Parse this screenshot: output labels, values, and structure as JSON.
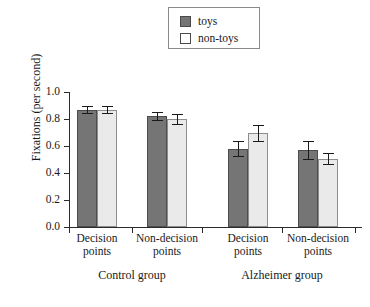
{
  "chart_data": {
    "type": "bar",
    "title": "",
    "xlabel": "",
    "ylabel": "Fixations (per second)",
    "ylim": [
      0.0,
      1.0
    ],
    "ytick_labels": [
      "1.0",
      "0.8",
      "0.6",
      "0.4",
      "0.2",
      "0.0"
    ],
    "ytick_values": [
      1.0,
      0.8,
      0.6,
      0.4,
      0.2,
      0.0
    ],
    "grid": false,
    "legend_position": "top-center",
    "categories": [
      "Decision points",
      "Non-decision points",
      "Decision points",
      "Non-decision points"
    ],
    "group_labels": [
      "Control group",
      "Alzheimer group"
    ],
    "series": [
      {
        "name": "toys",
        "color": "#757575",
        "values": [
          0.87,
          0.825,
          0.58,
          0.57
        ],
        "errors": [
          0.025,
          0.03,
          0.055,
          0.065
        ]
      },
      {
        "name": "non-toys",
        "color": "#eaeaea",
        "values": [
          0.87,
          0.8,
          0.695,
          0.505
        ],
        "errors": [
          0.025,
          0.035,
          0.06,
          0.04
        ]
      }
    ]
  },
  "legend": {
    "items": [
      {
        "label": "toys",
        "swatch": "toys-swatch"
      },
      {
        "label": "non-toys",
        "swatch": "non-toys-swatch"
      }
    ]
  },
  "axis": {
    "y_label": "Fixations (per second)",
    "ticks": [
      {
        "label": "1.0"
      },
      {
        "label": "0.8"
      },
      {
        "label": "0.6"
      },
      {
        "label": "0.4"
      },
      {
        "label": "0.2"
      },
      {
        "label": "0.0"
      }
    ]
  },
  "categories": [
    {
      "line1": "Decision",
      "line2": "points"
    },
    {
      "line1": "Non-decision",
      "line2": "points"
    },
    {
      "line1": "Decision",
      "line2": "points"
    },
    {
      "line1": "Non-decision",
      "line2": "points"
    }
  ],
  "groups": [
    {
      "label": "Control group"
    },
    {
      "label": "Alzheimer group"
    }
  ]
}
